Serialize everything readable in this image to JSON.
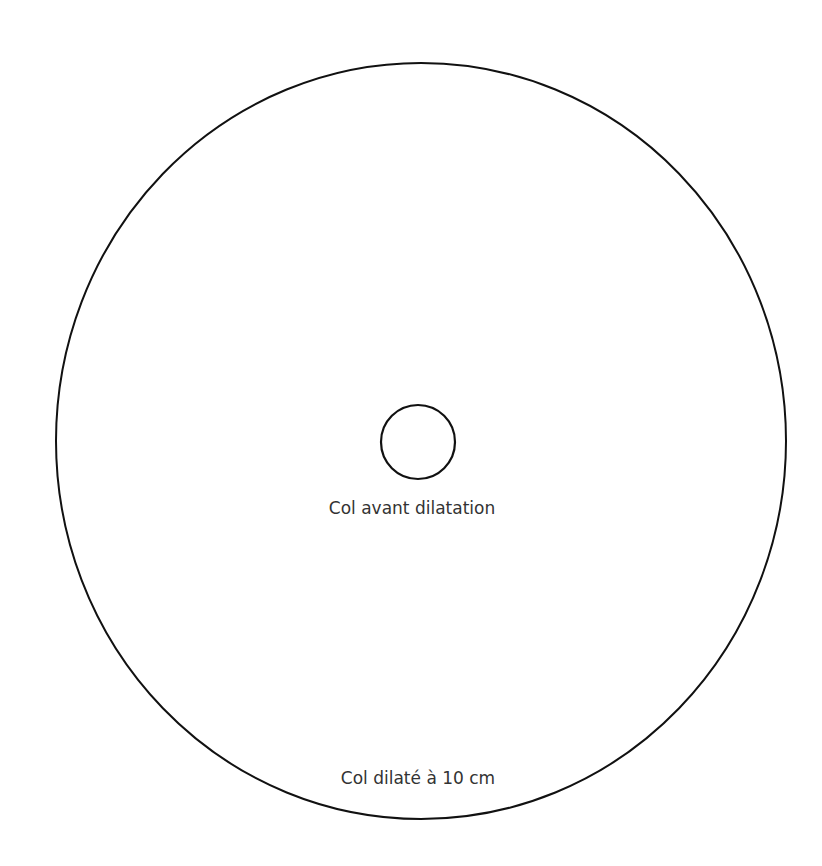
{
  "diagram": {
    "outer_circle": {
      "label": "Col dilaté à 10 cm",
      "cx": 421,
      "cy": 441,
      "rx": 365,
      "ry": 378,
      "stroke": "#111111"
    },
    "inner_circle": {
      "label": "Col avant dilatation",
      "cx": 418,
      "cy": 442,
      "r": 37,
      "stroke": "#111111"
    },
    "text_color": "#333333",
    "background": "#ffffff"
  }
}
